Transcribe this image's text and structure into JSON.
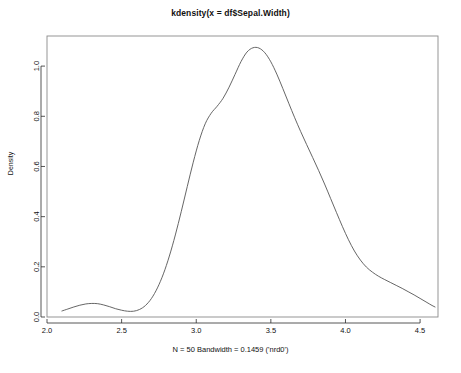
{
  "chart_data": {
    "type": "line",
    "title": "kdensity(x = df$Sepal.Width)",
    "subtitle": "N = 50   Bandwidth = 0.1459 ('nrd0')",
    "xlabel": "",
    "ylabel": "Density",
    "xlim": [
      2.0,
      4.62
    ],
    "ylim": [
      0.0,
      1.12
    ],
    "xticks": [
      2.0,
      2.5,
      3.0,
      3.5,
      4.0,
      4.5
    ],
    "xticklabels": [
      "2.0",
      "2.5",
      "3.0",
      "3.5",
      "4.0",
      "4.5"
    ],
    "yticks": [
      0.0,
      0.2,
      0.4,
      0.6,
      0.8,
      1.0
    ],
    "yticklabels": [
      "0.0",
      "0.2",
      "0.4",
      "0.6",
      "0.8",
      "1.0"
    ],
    "grid": false,
    "legend": null,
    "n": 50,
    "bandwidth": 0.1459,
    "kernel": "nrd0",
    "line_color": "#555555",
    "series": [
      {
        "name": "Density",
        "x": [
          2.1,
          2.14,
          2.18,
          2.22,
          2.26,
          2.3,
          2.34,
          2.38,
          2.42,
          2.46,
          2.5,
          2.54,
          2.58,
          2.62,
          2.66,
          2.7,
          2.74,
          2.78,
          2.82,
          2.86,
          2.9,
          2.94,
          2.98,
          3.02,
          3.06,
          3.1,
          3.14,
          3.18,
          3.22,
          3.26,
          3.3,
          3.34,
          3.38,
          3.42,
          3.46,
          3.5,
          3.54,
          3.58,
          3.62,
          3.66,
          3.7,
          3.74,
          3.78,
          3.82,
          3.86,
          3.9,
          3.94,
          3.98,
          4.02,
          4.06,
          4.1,
          4.14,
          4.18,
          4.22,
          4.26,
          4.3,
          4.34,
          4.38,
          4.42,
          4.46,
          4.5,
          4.54,
          4.58,
          4.6
        ],
        "y": [
          0.024,
          0.032,
          0.04,
          0.047,
          0.052,
          0.054,
          0.053,
          0.048,
          0.041,
          0.033,
          0.027,
          0.023,
          0.023,
          0.03,
          0.046,
          0.074,
          0.116,
          0.172,
          0.243,
          0.327,
          0.421,
          0.52,
          0.617,
          0.703,
          0.77,
          0.812,
          0.84,
          0.872,
          0.916,
          0.967,
          1.018,
          1.056,
          1.073,
          1.072,
          1.053,
          1.017,
          0.968,
          0.911,
          0.852,
          0.794,
          0.739,
          0.687,
          0.636,
          0.584,
          0.53,
          0.473,
          0.416,
          0.36,
          0.308,
          0.263,
          0.227,
          0.199,
          0.179,
          0.163,
          0.15,
          0.138,
          0.126,
          0.114,
          0.101,
          0.088,
          0.074,
          0.06,
          0.046,
          0.04
        ]
      }
    ]
  },
  "plot_box": {
    "left": 47,
    "right": 438,
    "top": 36,
    "bottom": 317
  }
}
